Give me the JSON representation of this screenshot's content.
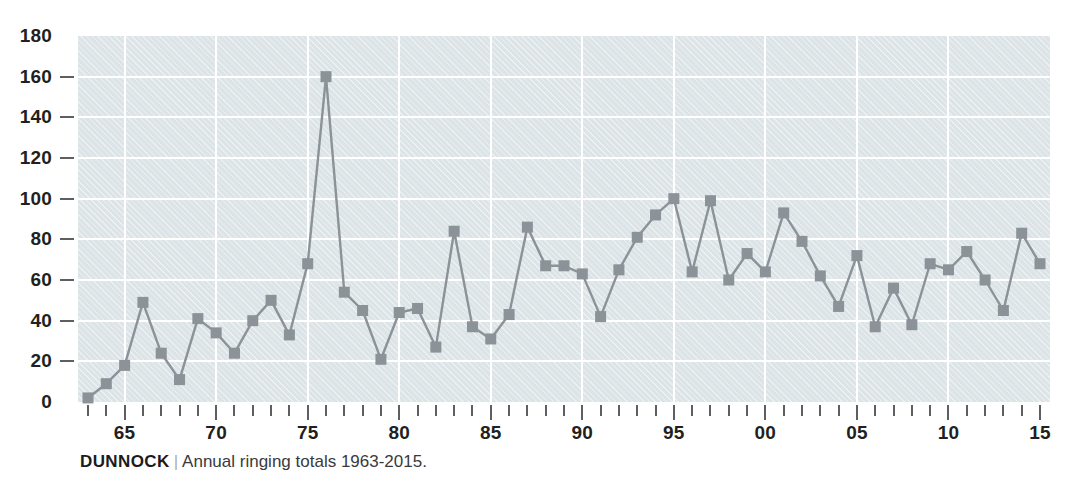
{
  "caption": {
    "species": "DUNNOCK",
    "separator": "|",
    "description": "Annual ringing totals 1963-2015."
  },
  "colors": {
    "plot_background": "#dde4e7",
    "gridline": "#ffffff",
    "series_line": "#8b9298",
    "marker": "#8b9298",
    "axis_text": "#231f20",
    "tick": "#5d5f61",
    "page_background": "#ffffff"
  },
  "chart_data": {
    "type": "line",
    "xlabel": "",
    "ylabel": "",
    "ylim": [
      0,
      180
    ],
    "ytick_values": [
      0,
      20,
      40,
      60,
      80,
      100,
      120,
      140,
      160,
      180
    ],
    "ytick_labels": [
      "0",
      "20",
      "40",
      "60",
      "80",
      "100",
      "120",
      "140",
      "160",
      "180"
    ],
    "xlim": [
      1963,
      2015
    ],
    "xtick_values": [
      1965,
      1970,
      1975,
      1980,
      1985,
      1990,
      1995,
      2000,
      2005,
      2010,
      2015
    ],
    "xtick_labels": [
      "65",
      "70",
      "75",
      "80",
      "85",
      "90",
      "95",
      "00",
      "05",
      "10",
      "15"
    ],
    "minor_xticks_every": 1,
    "grid": "both",
    "legend": "none",
    "marker": "square",
    "x": [
      1963,
      1964,
      1965,
      1966,
      1967,
      1968,
      1969,
      1970,
      1971,
      1972,
      1973,
      1974,
      1975,
      1976,
      1977,
      1978,
      1979,
      1980,
      1981,
      1982,
      1983,
      1984,
      1985,
      1986,
      1987,
      1988,
      1989,
      1990,
      1991,
      1992,
      1993,
      1994,
      1995,
      1996,
      1997,
      1998,
      1999,
      2000,
      2001,
      2002,
      2003,
      2004,
      2005,
      2006,
      2007,
      2008,
      2009,
      2010,
      2011,
      2012,
      2013,
      2014,
      2015
    ],
    "values": [
      2,
      9,
      18,
      49,
      24,
      11,
      41,
      34,
      24,
      40,
      50,
      33,
      68,
      160,
      54,
      45,
      21,
      44,
      46,
      27,
      84,
      37,
      31,
      43,
      86,
      67,
      67,
      63,
      42,
      65,
      81,
      92,
      100,
      64,
      99,
      60,
      73,
      64,
      93,
      79,
      62,
      47,
      72,
      37,
      56,
      38,
      68,
      65,
      74,
      60,
      45,
      83,
      68
    ],
    "series": [
      {
        "name": "Annual ringing totals",
        "values": [
          2,
          9,
          18,
          49,
          24,
          11,
          41,
          34,
          24,
          40,
          50,
          33,
          68,
          160,
          54,
          45,
          21,
          44,
          46,
          27,
          84,
          37,
          31,
          43,
          86,
          67,
          67,
          63,
          42,
          65,
          81,
          92,
          100,
          64,
          99,
          60,
          73,
          64,
          93,
          79,
          62,
          47,
          72,
          37,
          56,
          38,
          68,
          65,
          74,
          60,
          45,
          83,
          68
        ]
      }
    ]
  }
}
